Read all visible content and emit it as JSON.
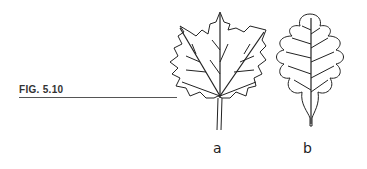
{
  "figure": {
    "label": "FIG. 5.10",
    "panels": [
      {
        "id": "a",
        "label": "a",
        "description": "lobed leaf with pointed teeth (maple-like)"
      },
      {
        "id": "b",
        "label": "b",
        "description": "rounded lobed leaf (oak-like)"
      }
    ]
  }
}
